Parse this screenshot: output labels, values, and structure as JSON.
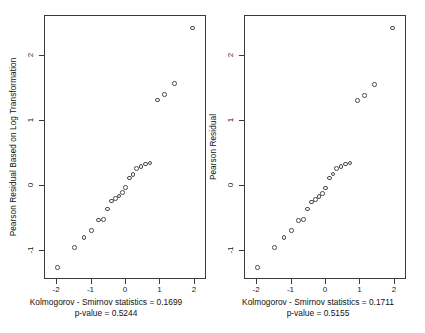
{
  "figure": {
    "type": "multi-panel-qq-plot",
    "panel_count": 2,
    "background": "#ffffff",
    "frame_color": "#3c3c3c",
    "point_color": "#4a4a4a"
  },
  "chart_data": [
    {
      "type": "scatter",
      "title": "",
      "xlabel": "",
      "ylabel": "Pearson Residual Based on Log Transformation",
      "xlim": [
        -2.35,
        2.35
      ],
      "ylim": [
        -1.45,
        2.62
      ],
      "xticks": [
        -2,
        -1,
        0,
        1,
        2
      ],
      "xticklabels": [
        "-2",
        "-1",
        "0",
        "1",
        "2"
      ],
      "yticks": [
        -1,
        0,
        1,
        2
      ],
      "yticklabels": [
        "-1",
        "0",
        "1",
        "2"
      ],
      "grid": false,
      "legend": null,
      "annotation_line1": "Kolmogorov - Smirnov statistics = 0.1699",
      "annotation_line2": "p-value = 0.5244",
      "x": [
        -1.96,
        -1.47,
        -1.19,
        -0.97,
        -0.77,
        -0.63,
        -0.51,
        -0.39,
        -0.28,
        -0.18,
        -0.08,
        0.02,
        0.13,
        0.23,
        0.34,
        0.46,
        0.59,
        0.73,
        0.95,
        1.15,
        1.44,
        1.96
      ],
      "y": [
        -1.27,
        -0.96,
        -0.81,
        -0.7,
        -0.54,
        -0.53,
        -0.37,
        -0.25,
        -0.21,
        -0.17,
        -0.12,
        -0.04,
        0.11,
        0.16,
        0.25,
        0.28,
        0.32,
        0.34,
        1.31,
        1.39,
        1.56,
        2.42
      ]
    },
    {
      "type": "scatter",
      "title": "",
      "xlabel": "",
      "ylabel": "Pearson Residual",
      "xlim": [
        -2.35,
        2.35
      ],
      "ylim": [
        -1.45,
        2.62
      ],
      "xticks": [
        -2,
        -1,
        0,
        1,
        2
      ],
      "xticklabels": [
        "-2",
        "-1",
        "0",
        "1",
        "2"
      ],
      "yticks": [
        -1,
        0,
        1,
        2
      ],
      "yticklabels": [
        "-1",
        "0",
        "1",
        "2"
      ],
      "grid": false,
      "legend": null,
      "annotation_line1": "Kolmogorov - Smirnov statistics = 0.1711",
      "annotation_line2": "p-value = 0.5155",
      "x": [
        -1.96,
        -1.47,
        -1.19,
        -0.97,
        -0.77,
        -0.63,
        -0.51,
        -0.39,
        -0.28,
        -0.18,
        -0.08,
        0.02,
        0.13,
        0.23,
        0.34,
        0.46,
        0.59,
        0.73,
        0.95,
        1.15,
        1.44,
        1.96
      ],
      "y": [
        -1.27,
        -0.96,
        -0.81,
        -0.7,
        -0.55,
        -0.53,
        -0.37,
        -0.26,
        -0.22,
        -0.18,
        -0.13,
        -0.05,
        0.11,
        0.17,
        0.25,
        0.28,
        0.32,
        0.34,
        1.3,
        1.38,
        1.55,
        2.42
      ]
    }
  ]
}
